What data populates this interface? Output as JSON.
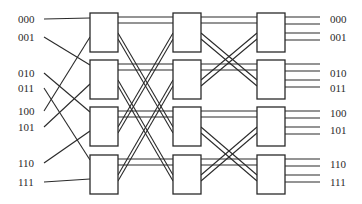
{
  "diagram": {
    "type": "multistage interconnection network (Omega/butterfly, 8x8, 3 stages of 4 switches)",
    "inputs": [
      "000",
      "001",
      "010",
      "011",
      "100",
      "101",
      "110",
      "111"
    ],
    "outputs": [
      "000",
      "001",
      "010",
      "011",
      "100",
      "101",
      "110",
      "111"
    ],
    "stages": 3,
    "switches_per_stage": 4,
    "colors": {
      "line": "#2a2a2a",
      "background": "#ffffff"
    }
  }
}
